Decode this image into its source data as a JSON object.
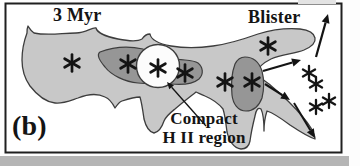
{
  "figure": {
    "labels": {
      "age": "3 Myr",
      "blister": "Blister",
      "panel": "(b)",
      "compact_line1": "Compact",
      "compact_line2": "H II region"
    },
    "colors": {
      "paper": "#fdfdfd",
      "ink": "#141414",
      "cloud": "#c8c8c8",
      "dense_core": "#969696",
      "hii_region": "#fcfcfc",
      "outline": "#3d3d3d",
      "scan_strip": "#b5b5b5"
    },
    "stars_in_cloud": [
      [
        72,
        63
      ],
      [
        128,
        64
      ],
      [
        158,
        68
      ],
      [
        185,
        73
      ],
      [
        225,
        82
      ],
      [
        252,
        82
      ],
      [
        268,
        46
      ]
    ],
    "stars_escaped": [
      [
        309,
        73
      ],
      [
        316,
        84
      ],
      [
        316,
        107
      ],
      [
        329,
        101
      ]
    ],
    "star_size_in": 8.5,
    "star_size_out": 7,
    "arrows": [
      {
        "name": "outflow-arrow-top",
        "x1": 316,
        "y1": 57,
        "x2": 328,
        "y2": 14,
        "w": 2.2,
        "head": 9
      },
      {
        "name": "outflow-arrow-mid",
        "x1": 263,
        "y1": 71,
        "x2": 301,
        "y2": 60,
        "w": 2.2,
        "head": 9
      },
      {
        "name": "outflow-arrow-lower",
        "x1": 265,
        "y1": 84,
        "x2": 290,
        "y2": 100,
        "w": 2.2,
        "head": 9
      },
      {
        "name": "outflow-arrow-bottom",
        "x1": 294,
        "y1": 103,
        "x2": 315,
        "y2": 138,
        "w": 2.0,
        "head": 9
      },
      {
        "name": "compact-hii-pointer",
        "x1": 206,
        "y1": 126,
        "x2": 167,
        "y2": 82,
        "w": 1.3,
        "head": 7
      }
    ]
  }
}
